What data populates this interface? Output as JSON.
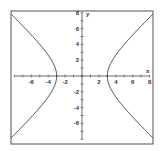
{
  "chart_data": {
    "type": "line",
    "title": "",
    "equation": "x^2/9 - y^2/9 = 1",
    "xlabel": "x",
    "ylabel": "y",
    "xlim": [
      -8,
      8
    ],
    "ylim": [
      -8,
      8
    ],
    "grid": false,
    "x_ticks": [
      -6,
      -4,
      -2,
      2,
      4,
      6,
      8
    ],
    "y_ticks": [
      8,
      6,
      4,
      2,
      -2,
      -4,
      -6
    ],
    "series": [
      {
        "name": "right branch",
        "vertex": [
          3,
          0
        ]
      },
      {
        "name": "left branch",
        "vertex": [
          -3,
          0
        ]
      }
    ],
    "colors": {
      "curve": "#333333",
      "axis": "#444444",
      "frame": "#555555"
    }
  },
  "axis_labels": {
    "x": "x",
    "y": "y"
  }
}
